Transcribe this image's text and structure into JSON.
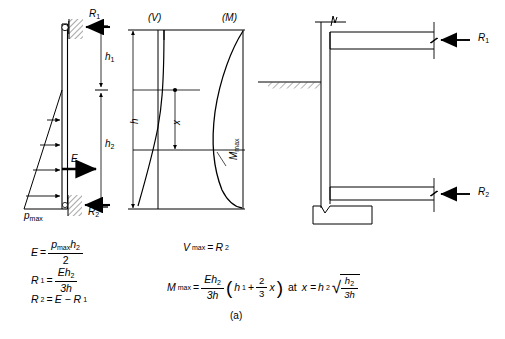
{
  "figure": {
    "caption": "(a)",
    "panels": {
      "left": {
        "name": "pressure-and-wall-diagram",
        "labels": {
          "R1": "R",
          "R1_sub": "1",
          "R2": "R",
          "R2_sub": "2",
          "h1": "h",
          "h1_sub": "1",
          "h2": "h",
          "h2_sub": "2",
          "E": "E",
          "pmax": "p",
          "pmax_sub": "max"
        }
      },
      "middle": {
        "name": "shear-and-moment-diagram",
        "labels": {
          "V": "(V)",
          "M": "(M)",
          "h": "h",
          "x": "x",
          "Mmax": "M",
          "Mmax_sub": "max"
        }
      },
      "right": {
        "name": "braced-wall-section",
        "labels": {
          "R1": "R",
          "R1_sub": "1",
          "R2": "R",
          "R2_sub": "2"
        }
      }
    },
    "equations": {
      "left": [
        {
          "id": "eq-E",
          "lhs": "E",
          "lhs_sub": "",
          "num": "p",
          "num_sub": "max",
          "num_tail": "h",
          "num_tail_sub": "2",
          "den": "2"
        },
        {
          "id": "eq-R1",
          "lhs": "R",
          "lhs_sub": "1",
          "num": "Eh",
          "num_sub": "2",
          "den": "3h"
        },
        {
          "id": "eq-R2",
          "lhs": "R",
          "lhs_sub": "2",
          "rhs": "E − R",
          "rhs_sub": "1"
        }
      ],
      "right": {
        "vmax": {
          "lhs": "V",
          "lhs_sub": "max",
          "rhs": "R",
          "rhs_sub": "2"
        },
        "mmax": {
          "lhs": "M",
          "lhs_sub": "max",
          "frac_num": "Eh",
          "frac_num_sub": "2",
          "frac_den": "3h",
          "paren_open": "(",
          "paren_h1": "h",
          "paren_h1_sub": "1",
          "plus": "+",
          "two_thirds_num": "2",
          "two_thirds_den": "3",
          "x": "x",
          "paren_close": ")",
          "at": "at",
          "x_eq": "x =",
          "h2": "h",
          "h2_sub": "2",
          "rad_num": "h",
          "rad_num_sub": "2",
          "rad_den": "3h"
        }
      }
    }
  }
}
